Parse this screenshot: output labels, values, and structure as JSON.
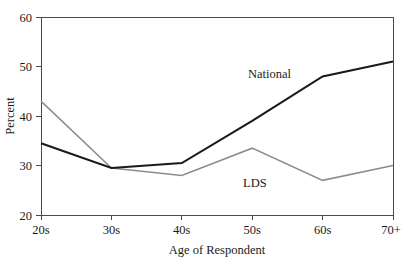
{
  "chart_data": {
    "type": "line",
    "title": "",
    "xlabel": "Age of Respondent",
    "ylabel": "Percent",
    "categories": [
      "20s",
      "30s",
      "40s",
      "50s",
      "60s",
      "70+"
    ],
    "ylim": [
      20,
      60
    ],
    "yticks": [
      20,
      30,
      40,
      50,
      60
    ],
    "ytick_labels": [
      "20",
      "30",
      "40",
      "50",
      "60"
    ],
    "grid": false,
    "legend_position": "inline-annotation",
    "series": [
      {
        "name": "National",
        "color": "#1a1a1a",
        "line_width": 2.1,
        "values": [
          34.5,
          29.5,
          30.5,
          39.0,
          48.0,
          51.0
        ],
        "label": "National",
        "label_x": 248,
        "label_y": 78
      },
      {
        "name": "LDS",
        "color": "#8c8c8c",
        "line_width": 1.5,
        "values": [
          43.0,
          29.5,
          28.0,
          33.5,
          27.0,
          30.0
        ],
        "label": "LDS",
        "label_x": 243,
        "label_y": 187
      }
    ]
  },
  "axes": {
    "plot_left": 41,
    "plot_right": 393,
    "plot_top": 17,
    "plot_bottom": 215,
    "axis_color": "#4a4a4a"
  },
  "labels": {
    "y_axis_title": "Percent",
    "x_axis_title": "Age of Respondent",
    "y_ticks": [
      "60",
      "50",
      "40",
      "30",
      "20"
    ],
    "x_ticks": [
      "20s",
      "30s",
      "40s",
      "50s",
      "60s",
      "70+"
    ],
    "series_national": "National",
    "series_lds": "LDS"
  }
}
